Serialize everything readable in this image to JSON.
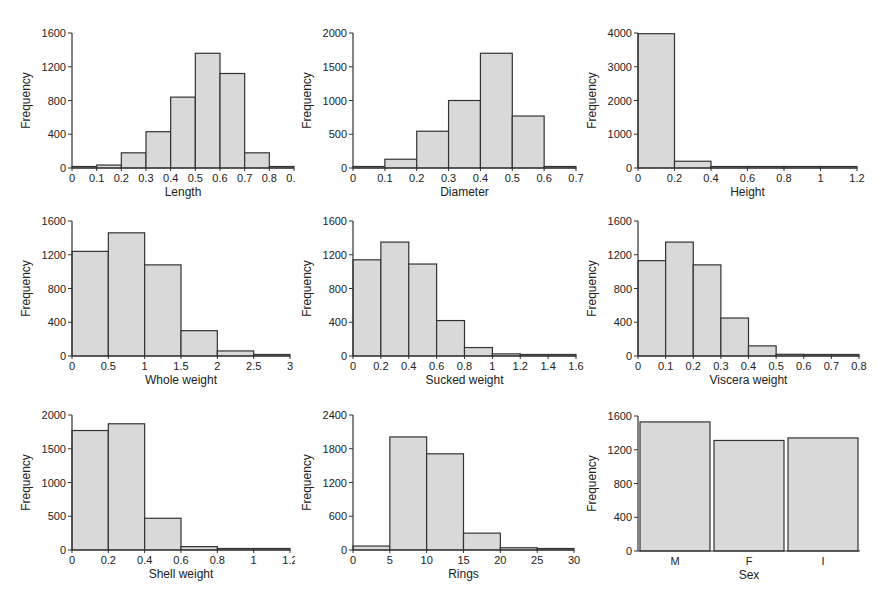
{
  "chart_data": [
    {
      "type": "bar",
      "title": "",
      "xlabel": "Length",
      "ylabel": "Frequency",
      "bins": [
        0,
        0.1,
        0.2,
        0.3,
        0.4,
        0.5,
        0.6,
        0.7,
        0.8,
        0.9
      ],
      "values": [
        5,
        35,
        180,
        430,
        840,
        1360,
        1120,
        180,
        5
      ],
      "xticks": [
        "0",
        "0.1",
        "0.2",
        "0.3",
        "0.4",
        "0.5",
        "0.6",
        "0.7",
        "0.8",
        "0.9"
      ],
      "yticks": [
        0,
        400,
        800,
        1200,
        1600
      ],
      "ylim": [
        0,
        1600
      ]
    },
    {
      "type": "bar",
      "title": "",
      "xlabel": "Diameter",
      "ylabel": "Frequency",
      "bins": [
        0,
        0.1,
        0.2,
        0.3,
        0.4,
        0.5,
        0.6,
        0.7
      ],
      "values": [
        15,
        130,
        545,
        1000,
        1700,
        770,
        10
      ],
      "xticks": [
        "0",
        "0.1",
        "0.2",
        "0.3",
        "0.4",
        "0.5",
        "0.6",
        "0.7"
      ],
      "yticks": [
        0,
        500,
        1000,
        1500,
        2000
      ],
      "ylim": [
        0,
        2000
      ]
    },
    {
      "type": "bar",
      "title": "",
      "xlabel": "Height",
      "ylabel": "Frequency",
      "bins": [
        0,
        0.2,
        0.4,
        0.6,
        0.8,
        1.0,
        1.2
      ],
      "values": [
        3980,
        200,
        30,
        5,
        5,
        25
      ],
      "xticks": [
        "0",
        "0.2",
        "0.4",
        "0.6",
        "0.8",
        "1",
        "1.2"
      ],
      "yticks": [
        0,
        1000,
        2000,
        3000,
        4000
      ],
      "ylim": [
        0,
        4000
      ]
    },
    {
      "type": "bar",
      "title": "",
      "xlabel": "Whole weight",
      "ylabel": "Frequency",
      "bins": [
        0,
        0.5,
        1.0,
        1.5,
        2.0,
        2.5,
        3.0
      ],
      "values": [
        1240,
        1460,
        1080,
        300,
        60,
        15
      ],
      "xticks": [
        "0",
        "0.5",
        "1",
        "1.5",
        "2",
        "2.5",
        "3"
      ],
      "yticks": [
        0,
        400,
        800,
        1200,
        1600
      ],
      "ylim": [
        0,
        1600
      ]
    },
    {
      "type": "bar",
      "title": "",
      "xlabel": "Sucked weight",
      "ylabel": "Frequency",
      "bins": [
        0,
        0.2,
        0.4,
        0.6,
        0.8,
        1.0,
        1.2,
        1.4,
        1.6
      ],
      "values": [
        1140,
        1350,
        1090,
        420,
        100,
        25,
        10,
        5
      ],
      "xticks": [
        "0",
        "0.2",
        "0.4",
        "0.6",
        "0.8",
        "1",
        "1.2",
        "1.4",
        "1.6"
      ],
      "yticks": [
        0,
        400,
        800,
        1200,
        1600
      ],
      "ylim": [
        0,
        1600
      ]
    },
    {
      "type": "bar",
      "title": "",
      "xlabel": "Viscera weight",
      "ylabel": "Frequency",
      "bins": [
        0,
        0.1,
        0.2,
        0.3,
        0.4,
        0.5,
        0.6,
        0.7,
        0.8
      ],
      "values": [
        1130,
        1350,
        1080,
        450,
        120,
        20,
        5,
        5
      ],
      "xticks": [
        "0",
        "0.1",
        "0.2",
        "0.3",
        "0.4",
        "0.5",
        "0.6",
        "0.7",
        "0.8"
      ],
      "yticks": [
        0,
        400,
        800,
        1200,
        1600
      ],
      "ylim": [
        0,
        1600
      ]
    },
    {
      "type": "bar",
      "title": "",
      "xlabel": "Shell weight",
      "ylabel": "Frequency",
      "bins": [
        0,
        0.2,
        0.4,
        0.6,
        0.8,
        1.0,
        1.2
      ],
      "values": [
        1770,
        1870,
        470,
        50,
        5,
        0
      ],
      "xticks": [
        "0",
        "0.2",
        "0.4",
        "0.6",
        "0.8",
        "1",
        "1.2"
      ],
      "yticks": [
        0,
        500,
        1000,
        1500,
        2000
      ],
      "ylim": [
        0,
        2000
      ]
    },
    {
      "type": "bar",
      "title": "",
      "xlabel": "Rings",
      "ylabel": "Frequency",
      "bins": [
        0,
        5,
        10,
        15,
        20,
        25,
        30
      ],
      "values": [
        70,
        2010,
        1710,
        300,
        40,
        5
      ],
      "xticks": [
        "0",
        "5",
        "10",
        "15",
        "20",
        "25",
        "30"
      ],
      "yticks": [
        0,
        600,
        1200,
        1800,
        2400
      ],
      "ylim": [
        0,
        2400
      ]
    },
    {
      "type": "bar",
      "title": "",
      "xlabel": "Sex",
      "ylabel": "Frequency",
      "categories": [
        "M",
        "F",
        "I"
      ],
      "values": [
        1530,
        1310,
        1340
      ],
      "xticks": [
        "M",
        "F",
        "I"
      ],
      "yticks": [
        0,
        400,
        800,
        1200,
        1600
      ],
      "ylim": [
        0,
        1600
      ]
    }
  ],
  "style": {
    "bar_fill": "#d9d9d9",
    "bar_stroke": "#333333",
    "axis_color": "#333333"
  },
  "layout": {
    "panels": [
      {
        "left": 0,
        "top": 0
      },
      {
        "left": 290,
        "top": 0
      },
      {
        "left": 580,
        "top": 0
      },
      {
        "left": 0,
        "top": 200
      },
      {
        "left": 290,
        "top": 200
      },
      {
        "left": 580,
        "top": 200
      },
      {
        "left": 0,
        "top": 400
      },
      {
        "left": 290,
        "top": 400
      },
      {
        "left": 580,
        "top": 400
      }
    ],
    "plot_areas": [
      {
        "x0": 72,
        "y0": 33,
        "x1": 294,
        "y1": 168
      },
      {
        "x0": 63,
        "y0": 33,
        "x1": 286,
        "y1": 168
      },
      {
        "x0": 58,
        "y0": 33,
        "x1": 277,
        "y1": 168
      },
      {
        "x0": 72,
        "y0": 21,
        "x1": 290,
        "y1": 156
      },
      {
        "x0": 63,
        "y0": 21,
        "x1": 286,
        "y1": 156
      },
      {
        "x0": 58,
        "y0": 21,
        "x1": 279,
        "y1": 156
      },
      {
        "x0": 72,
        "y0": 15,
        "x1": 290,
        "y1": 150
      },
      {
        "x0": 63,
        "y0": 15,
        "x1": 284,
        "y1": 150
      },
      {
        "x0": 58,
        "y0": 16,
        "x1": 280,
        "y1": 151
      }
    ]
  }
}
